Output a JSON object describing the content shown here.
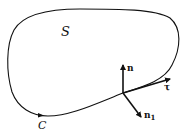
{
  "diagram": {
    "region_label": "S",
    "curve_label": "C",
    "vectors": [
      {
        "name": "n",
        "label": "n",
        "subscript": ""
      },
      {
        "name": "tau",
        "label": "τ",
        "subscript": ""
      },
      {
        "name": "n1",
        "label": "n",
        "subscript": "1"
      }
    ],
    "colors": {
      "stroke": "#111111",
      "background": "#ffffff"
    }
  }
}
